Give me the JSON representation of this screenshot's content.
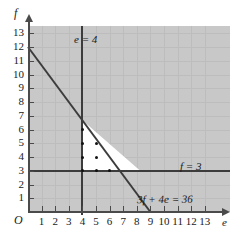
{
  "chart_data": {
    "type": "scatter",
    "title": "",
    "xlabel": "e",
    "ylabel": "f",
    "xlim": [
      0,
      13
    ],
    "ylim": [
      0,
      13
    ],
    "grid": true,
    "origin_label": "O",
    "x_ticks": [
      1,
      2,
      3,
      4,
      5,
      6,
      7,
      8,
      9,
      10,
      11,
      12,
      13
    ],
    "y_ticks": [
      1,
      2,
      3,
      4,
      5,
      6,
      7,
      8,
      9,
      10,
      11,
      12,
      13
    ],
    "constraints": [
      {
        "id": "vertical",
        "label": "e = 4",
        "equation": "e = 4",
        "orientation": "vertical",
        "x_value": 4,
        "color": "#3c3c3c"
      },
      {
        "id": "horizontal",
        "label": "f = 3",
        "equation": "f = 3",
        "orientation": "horizontal",
        "y_value": 3,
        "color": "#3c3c3c"
      },
      {
        "id": "diagonal",
        "label": "3f + 4e = 36",
        "equation": "3f + 4e = 36",
        "orientation": "diagonal",
        "x_intercept": 9,
        "y_intercept": 12,
        "color": "#3c3c3c"
      }
    ],
    "feasible_region": {
      "shaded_area_color": "#c8c8c8",
      "feasible_fill_color": "#ffffff",
      "vertices": [
        [
          4,
          3
        ],
        [
          4,
          6.667
        ],
        [
          8.25,
          3
        ]
      ]
    },
    "lattice_points": [
      {
        "e": 4,
        "f": 6
      },
      {
        "e": 4,
        "f": 5
      },
      {
        "e": 4,
        "f": 4
      },
      {
        "e": 4,
        "f": 3
      },
      {
        "e": 5,
        "f": 5
      },
      {
        "e": 5,
        "f": 4
      },
      {
        "e": 5,
        "f": 3
      },
      {
        "e": 6,
        "f": 3
      }
    ]
  },
  "axes": {
    "y_name": "f",
    "x_name": "e",
    "origin": "O"
  },
  "labels": {
    "vertical_line": "e = 4",
    "horizontal_line": "f = 3",
    "diagonal_line": "3f + 4e = 36"
  }
}
